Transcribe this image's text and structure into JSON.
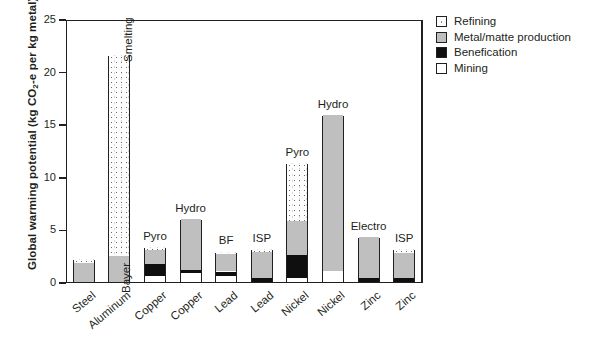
{
  "chart_data": {
    "type": "bar",
    "title": "",
    "xlabel": "",
    "ylabel": "Global warming potential (kg CO2-e per kg metal)",
    "ylabel_parts": {
      "pre": "Global warming potential (kg CO",
      "sub": "2",
      "post": "-e per kg metal)"
    },
    "ylim": [
      0,
      25
    ],
    "yticks": [
      0,
      5,
      10,
      15,
      20,
      25
    ],
    "ytick_labels": [
      "0",
      "5",
      "10",
      "15",
      "20",
      "25"
    ],
    "grid": false,
    "stacked": true,
    "legend_position": "top-right",
    "legend": [
      {
        "key": "refining",
        "label": "Refining",
        "fill": "stipple"
      },
      {
        "key": "metal",
        "label": "Metal/matte production",
        "fill": "#bfbfbf"
      },
      {
        "key": "benefication",
        "label": "Benefication",
        "fill": "#000000"
      },
      {
        "key": "mining",
        "label": "Mining",
        "fill": "#ffffff"
      }
    ],
    "series": [
      {
        "name": "Mining",
        "key": "mining",
        "values": [
          0,
          0,
          0.6,
          0.9,
          0.55,
          0,
          0.4,
          1.0,
          0,
          0
        ]
      },
      {
        "name": "Benefication",
        "key": "benefication",
        "values": [
          0,
          0,
          1.1,
          0.25,
          0.45,
          0.4,
          2.2,
          0,
          0.35,
          0.35
        ]
      },
      {
        "name": "Metal/matte production",
        "key": "metal",
        "values": [
          1.85,
          2.5,
          1.3,
          4.85,
          1.65,
          2.45,
          3.2,
          14.9,
          3.95,
          2.45
        ]
      },
      {
        "name": "Refining",
        "key": "refining",
        "values": [
          0.35,
          19.1,
          0.3,
          0,
          0.25,
          0.25,
          5.5,
          0,
          0,
          0.3
        ]
      }
    ],
    "categories": [
      {
        "metal": "Steel",
        "totals": 2.2,
        "annotation": "",
        "annotation_rotated": false
      },
      {
        "metal": "Aluminum",
        "totals": 21.6,
        "annotation": "Smelting",
        "annotation_rotated": true
      },
      {
        "metal": "Copper",
        "totals": 3.3,
        "annotation": "Pyro",
        "annotation_rotated": false,
        "annotation2": "Bayer",
        "annotation2_rotated": true
      },
      {
        "metal": "Copper",
        "totals": 6.0,
        "annotation": "Hydro",
        "annotation_rotated": false
      },
      {
        "metal": "Lead",
        "totals": 2.9,
        "annotation": "BF",
        "annotation_rotated": false
      },
      {
        "metal": "Lead",
        "totals": 3.1,
        "annotation": "ISP",
        "annotation_rotated": false
      },
      {
        "metal": "Nickel",
        "totals": 11.3,
        "annotation": "Pyro",
        "annotation_rotated": false
      },
      {
        "metal": "Nickel",
        "totals": 15.9,
        "annotation": "Hydro",
        "annotation_rotated": false
      },
      {
        "metal": "Zinc",
        "totals": 4.3,
        "annotation": "Electro",
        "annotation_rotated": false
      },
      {
        "metal": "Zinc",
        "totals": 3.1,
        "annotation": "ISP",
        "annotation_rotated": false
      }
    ]
  }
}
